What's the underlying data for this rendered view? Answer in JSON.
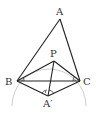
{
  "diagram": {
    "type": "geometry",
    "points": {
      "A": {
        "label": "A",
        "x": 60,
        "y": 19
      },
      "P": {
        "label": "P",
        "x": 54,
        "y": 61
      },
      "B": {
        "label": "B",
        "x": 17,
        "y": 81
      },
      "C": {
        "label": "C",
        "x": 80,
        "y": 81
      },
      "A_prime": {
        "label": "A′",
        "x": 48,
        "y": 96
      }
    },
    "segments": [
      "AB",
      "AC",
      "BC",
      "PB",
      "PC",
      "PA′",
      "BA′",
      "CA′"
    ],
    "circle": {
      "through": [
        "B",
        "P",
        "C",
        "A′"
      ],
      "color": "#c8c8c8"
    },
    "line_color": "#222222",
    "angle_marks": [
      "∠PBC",
      "∠PCB",
      "∠BA′P",
      "∠PA′C"
    ]
  }
}
